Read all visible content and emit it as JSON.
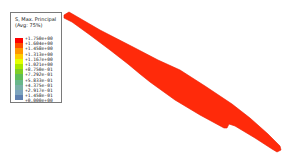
{
  "legend": {
    "title_line1": "S, Max. Principal",
    "title_line2": "(Avg: 75%)",
    "bands": [
      "#ff0000",
      "#ff4f00",
      "#ff9600",
      "#ffcc00",
      "#e4ff00",
      "#a7e800",
      "#7fce25",
      "#5fbd58",
      "#68b78a",
      "#7ab0a8",
      "#7da4bf",
      "#5f80b0",
      "#3c5598",
      "#1c2b78"
    ],
    "labels": [
      "+1.750e+00",
      "+1.604e+00",
      "+1.458e+00",
      "+1.313e+00",
      "+1.167e+00",
      "+1.021e+00",
      "+8.750e-01",
      "+7.292e-01",
      "+5.833e-01",
      "+4.375e-01",
      "+2.917e-01",
      "+1.458e-01",
      "+0.000e+00"
    ]
  },
  "model": {
    "fill_color": "#ff2a0a",
    "edge_color": "#e81a00"
  }
}
